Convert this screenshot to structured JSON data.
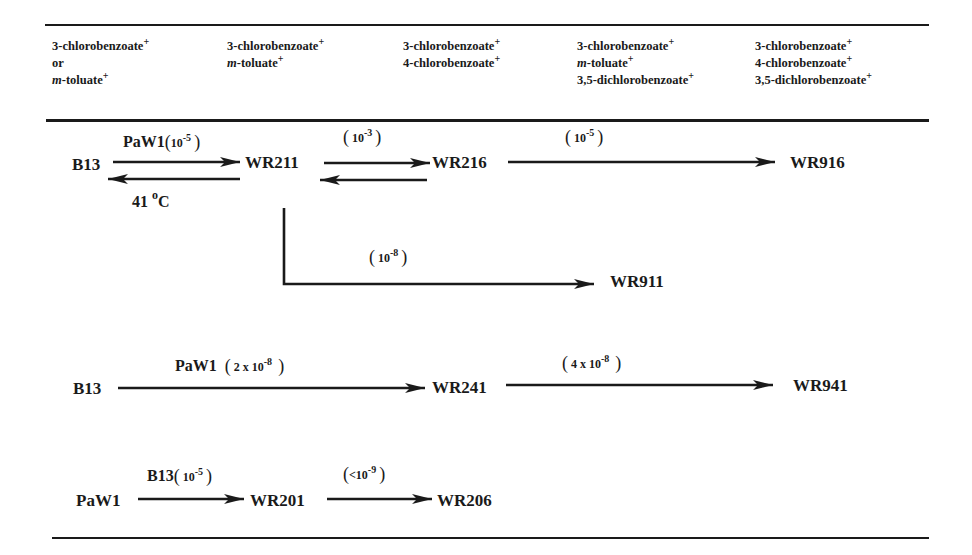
{
  "header": {
    "columns": [
      {
        "lines": [
          {
            "text": "3-chlorobenzoate",
            "sup": "+"
          },
          {
            "text": "or",
            "sup": ""
          },
          {
            "prefix": "m",
            "text": "-toluate",
            "sup": "+"
          }
        ]
      },
      {
        "lines": [
          {
            "text": "3-chlorobenzoate",
            "sup": "+"
          },
          {
            "prefix": "m",
            "text": "-toluate",
            "sup": "+"
          }
        ]
      },
      {
        "lines": [
          {
            "text": "3-chlorobenzoate",
            "sup": "+"
          },
          {
            "text": "4-chlorobenzoate",
            "sup": "+"
          }
        ]
      },
      {
        "lines": [
          {
            "text": "3-chlorobenzoate",
            "sup": "+"
          },
          {
            "prefix": "m",
            "text": "-toluate",
            "sup": "+"
          },
          {
            "text": "3,5-dichlorobenzoate",
            "sup": "+"
          }
        ]
      },
      {
        "lines": [
          {
            "text": "3-chlorobenzoate",
            "sup": "+"
          },
          {
            "text": "4-chlorobenzoate",
            "sup": "+"
          },
          {
            "text": "3,5-dichlorobenzoate",
            "sup": "+"
          }
        ]
      }
    ]
  },
  "pathway1": {
    "nodes": {
      "b13": "B13",
      "wr211": "WR211",
      "wr216": "WR216",
      "wr916": "WR916",
      "wr911": "WR911"
    },
    "edge_b13_wr211": {
      "donor": "PaW1",
      "base": "10",
      "exp": "-5"
    },
    "reverse_b13_wr211": {
      "temp": "41",
      "deg": "o",
      "unit": "C"
    },
    "edge_wr211_wr216": {
      "base": "10",
      "exp": "-3"
    },
    "edge_wr216_wr916": {
      "base": "10",
      "exp": "-5"
    },
    "edge_wr211_wr911": {
      "base": "10",
      "exp": "-8"
    }
  },
  "pathway2": {
    "nodes": {
      "b13": "B13",
      "wr241": "WR241",
      "wr941": "WR941"
    },
    "edge_b13_wr241": {
      "donor": "PaW1",
      "base": "2 x 10",
      "exp": "-8"
    },
    "edge_wr241_wr941": {
      "base": "4 x 10",
      "exp": "-8"
    }
  },
  "pathway3": {
    "nodes": {
      "paw1": "PaW1",
      "wr201": "WR201",
      "wr206": "WR206"
    },
    "edge_paw1_wr201": {
      "donor": "B13",
      "base": "10",
      "exp": "-5"
    },
    "edge_wr201_wr206": {
      "base": "<10",
      "exp": "-9"
    }
  },
  "symbols": {
    "open_paren": "(",
    "close_paren": ")"
  }
}
